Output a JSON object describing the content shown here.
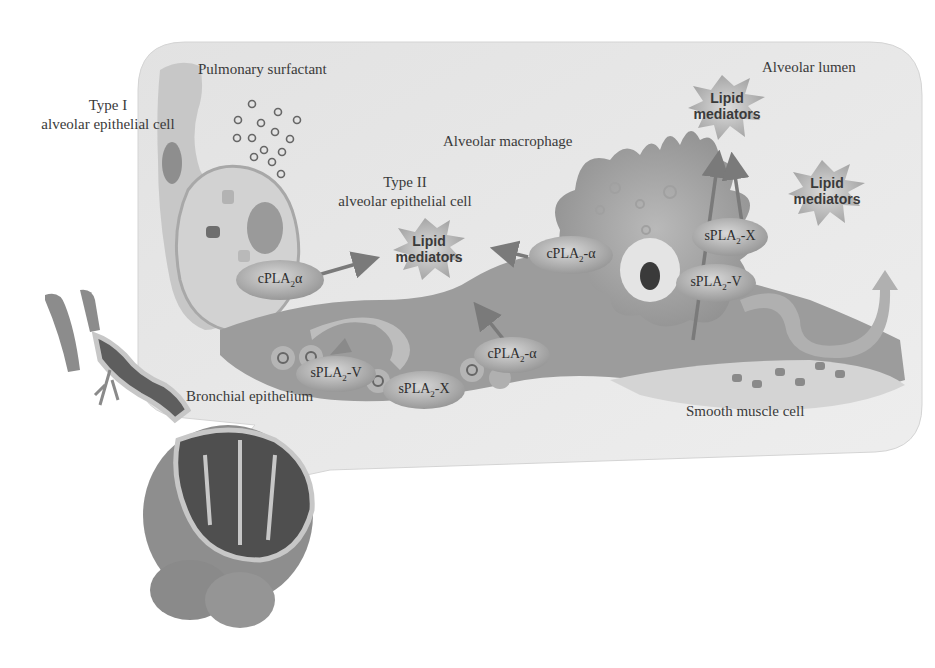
{
  "figure": {
    "title": "",
    "labels": {
      "pulmonary_surfactant": "Pulmonary surfactant",
      "type1_line1": "Type I",
      "type1_line2": "alveolar epithelial cell",
      "type2_line1": "Type II",
      "type2_line2": "alveolar epithelial cell",
      "alveolar_macrophage": "Alveolar macrophage",
      "alveolar_lumen": "Alveolar lumen",
      "bronchial_epithelium": "Bronchial epithelium",
      "smooth_muscle_cell": "Smooth muscle cell"
    },
    "lipid_mediators": [
      {
        "line1": "Lipid",
        "line2": "mediators",
        "position": "center"
      },
      {
        "line1": "Lipid",
        "line2": "mediators",
        "position": "top-right"
      },
      {
        "line1": "Lipid",
        "line2": "mediators",
        "position": "far-right"
      }
    ],
    "enzymes": {
      "type2_cpla2": {
        "base": "cPLA",
        "sub": "2",
        "suffix": "α"
      },
      "macrophage_cpla2": {
        "base": "cPLA",
        "sub": "2",
        "suffix": "-α"
      },
      "macrophage_spla2x": {
        "base": "sPLA",
        "sub": "2",
        "suffix": "-X"
      },
      "macrophage_spla2v": {
        "base": "sPLA",
        "sub": "2",
        "suffix": "-V"
      },
      "bronchial_spla2v": {
        "base": "sPLA",
        "sub": "2",
        "suffix": "-V"
      },
      "bronchial_spla2x": {
        "base": "sPLA",
        "sub": "2",
        "suffix": "-X"
      },
      "bronchial_cpla2": {
        "base": "cPLA",
        "sub": "2",
        "suffix": "-α"
      }
    },
    "colors": {
      "panel_bg": "#e9e9e9",
      "tissue": "#9c9c9c",
      "cell_light": "#c9c9c9",
      "arrow": "#7a7a7a",
      "burst": "#b5b5b5"
    }
  }
}
